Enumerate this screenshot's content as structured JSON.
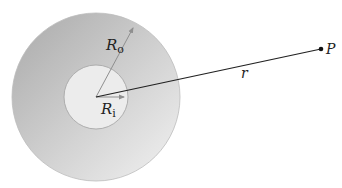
{
  "diagram": {
    "type": "concentric-shell-field-point",
    "outer_circle": {
      "cx": 96,
      "cy": 97,
      "r": 84,
      "gradient_dark": "#a9a9a9",
      "gradient_light": "#eeeeee",
      "stroke": "#bdbdbd"
    },
    "inner_circle": {
      "cx": 96,
      "cy": 97,
      "r": 32,
      "fill": "#ececec",
      "stroke": "#a8a8a8"
    },
    "labels": {
      "outer_radius": {
        "main": "R",
        "sub": "o"
      },
      "inner_radius": {
        "main": "R",
        "sub": "i"
      },
      "distance": "r",
      "point": "P"
    },
    "arrows": {
      "outer_radius": {
        "x1": 96,
        "y1": 97,
        "x2": 134,
        "y2": 26,
        "color": "#8f8f8f"
      },
      "inner_radius": {
        "x1": 96,
        "y1": 97,
        "x2": 126,
        "y2": 97,
        "color": "#8f8f8f"
      }
    },
    "distance_line": {
      "x1": 96,
      "y1": 97,
      "x2": 321,
      "y2": 49,
      "color": "#222222"
    },
    "point_P": {
      "cx": 321,
      "cy": 49,
      "r": 2.3,
      "color": "#111111"
    }
  }
}
